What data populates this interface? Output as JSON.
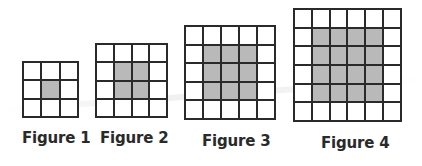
{
  "figures": [
    {
      "label": "Figure 1",
      "size": 3,
      "shaded_inner": 1,
      "box": {
        "left": 22,
        "top": 61,
        "width": 57,
        "height": 57
      },
      "label_pos": {
        "left": 22,
        "top": 129
      }
    },
    {
      "label": "Figure 2",
      "size": 4,
      "shaded_inner": 2,
      "box": {
        "left": 95,
        "top": 43,
        "width": 73,
        "height": 75
      },
      "label_pos": {
        "left": 100,
        "top": 129
      }
    },
    {
      "label": "Figure 3",
      "size": 5,
      "shaded_inner": 3,
      "box": {
        "left": 184,
        "top": 25,
        "width": 92,
        "height": 95
      },
      "label_pos": {
        "left": 202,
        "top": 132
      }
    },
    {
      "label": "Figure 4",
      "size": 6,
      "shaded_inner": 4,
      "box": {
        "left": 293,
        "top": 8,
        "width": 109,
        "height": 114
      },
      "label_pos": {
        "left": 321,
        "top": 134
      }
    }
  ],
  "colors": {
    "line": "#2a2a2a",
    "shaded": "#b9b9b9",
    "unshaded": "#ffffff"
  }
}
